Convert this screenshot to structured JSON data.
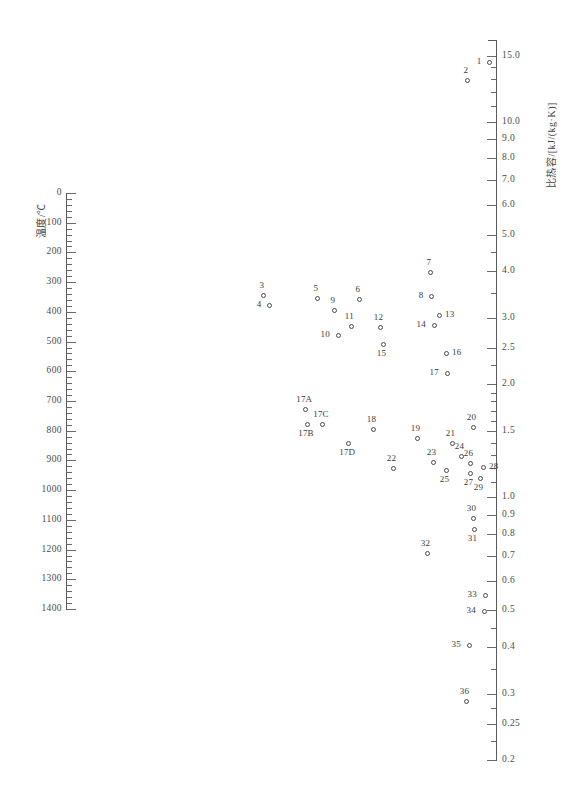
{
  "chart_data": {
    "type": "scatter",
    "title": "",
    "xlabel": "",
    "ylabel": "温度/℃",
    "y2label": "比热容/[kJ/(kg·K)]",
    "grid": false,
    "legend": "none",
    "left_axis": {
      "label": "温度/℃",
      "unit": "℃",
      "scale": "linear",
      "min": 0,
      "max": 1400,
      "major_step": 100,
      "minor_per_major": 5,
      "ticks": [
        0,
        100,
        200,
        300,
        400,
        500,
        600,
        700,
        800,
        900,
        1000,
        1100,
        1200,
        1300,
        1400
      ],
      "tick_labels": [
        "0",
        "100",
        "200",
        "300",
        "400",
        "500",
        "600",
        "700",
        "800",
        "900",
        "1000",
        "1100",
        "1200",
        "1300",
        "1400"
      ]
    },
    "right_axis": {
      "label": "比热容/[kJ/(kg·K)]",
      "unit": "kJ/(kg·K)",
      "scale": "log",
      "min": 0.2,
      "max": 16.5,
      "labeled_ticks": [
        15.0,
        10.0,
        9.0,
        8.0,
        7.0,
        6.0,
        5.0,
        4.0,
        3.0,
        2.5,
        2.0,
        1.5,
        1.0,
        0.9,
        0.8,
        0.7,
        0.6,
        0.5,
        0.4,
        0.3,
        0.25,
        0.2
      ],
      "labeled_tick_labels": [
        "15.0",
        "10.0",
        "9.0",
        "8.0",
        "7.0",
        "6.0",
        "5.0",
        "4.0",
        "3.0",
        "2.5",
        "2.0",
        "1.5",
        "1.0",
        "0.9",
        "0.8",
        "0.7",
        "0.6",
        "0.5",
        "0.4",
        "0.3",
        "0.25",
        "0.2"
      ],
      "minor_ticks": [
        14.0,
        13.0,
        12.0,
        11.0,
        4.5,
        3.5,
        2.25,
        1.9,
        1.8,
        1.7,
        1.6,
        1.4,
        1.3,
        1.2,
        1.1,
        0.45,
        0.35,
        0.275,
        0.225
      ]
    },
    "points": [
      {
        "id": "1",
        "label": "1",
        "x": 489,
        "y": 62,
        "specific_heat": 14.6,
        "label_pos": "left"
      },
      {
        "id": "2",
        "label": "2",
        "x": 467,
        "y": 80,
        "specific_heat": 13.1,
        "label_pos": "above"
      },
      {
        "id": "3",
        "label": "3",
        "x": 263,
        "y": 295,
        "specific_heat": 3.55,
        "label_pos": "above"
      },
      {
        "id": "4",
        "label": "4",
        "x": 269,
        "y": 305,
        "specific_heat": 3.4,
        "label_pos": "left"
      },
      {
        "id": "5",
        "label": "5",
        "x": 317,
        "y": 298,
        "specific_heat": 3.5,
        "label_pos": "above"
      },
      {
        "id": "6",
        "label": "6",
        "x": 359,
        "y": 299,
        "specific_heat": 3.48,
        "label_pos": "above"
      },
      {
        "id": "7",
        "label": "7",
        "x": 430,
        "y": 272,
        "specific_heat": 3.95,
        "label_pos": "above"
      },
      {
        "id": "8",
        "label": "8",
        "x": 431,
        "y": 296,
        "specific_heat": 3.55,
        "label_pos": "left"
      },
      {
        "id": "9",
        "label": "9",
        "x": 334,
        "y": 310,
        "specific_heat": 3.3,
        "label_pos": "above"
      },
      {
        "id": "10",
        "label": "10",
        "x": 338,
        "y": 335,
        "specific_heat": 2.95,
        "label_pos": "left"
      },
      {
        "id": "11",
        "label": "11",
        "x": 351,
        "y": 326,
        "specific_heat": 3.07,
        "label_pos": "above"
      },
      {
        "id": "12",
        "label": "12",
        "x": 380,
        "y": 327,
        "specific_heat": 3.05,
        "label_pos": "above"
      },
      {
        "id": "13",
        "label": "13",
        "x": 439,
        "y": 315,
        "specific_heat": 3.2,
        "label_pos": "right"
      },
      {
        "id": "14",
        "label": "14",
        "x": 434,
        "y": 325,
        "specific_heat": 3.08,
        "label_pos": "left"
      },
      {
        "id": "15",
        "label": "15",
        "x": 383,
        "y": 344,
        "specific_heat": 2.8,
        "label_pos": "below"
      },
      {
        "id": "16",
        "label": "16",
        "x": 446,
        "y": 353,
        "specific_heat": 2.55,
        "label_pos": "right"
      },
      {
        "id": "17",
        "label": "17",
        "x": 447,
        "y": 373,
        "specific_heat": 2.05,
        "label_pos": "left"
      },
      {
        "id": "17A",
        "label": "17A",
        "x": 305,
        "y": 409,
        "specific_heat": 1.72,
        "label_pos": "above"
      },
      {
        "id": "17B",
        "label": "17B",
        "x": 307,
        "y": 424,
        "specific_heat": 1.52,
        "label_pos": "below"
      },
      {
        "id": "17C",
        "label": "17C",
        "x": 322,
        "y": 424,
        "specific_heat": 1.52,
        "label_pos": "above"
      },
      {
        "id": "17D",
        "label": "17D",
        "x": 348,
        "y": 443,
        "specific_heat": 1.38,
        "label_pos": "below"
      },
      {
        "id": "18",
        "label": "18",
        "x": 373,
        "y": 429,
        "specific_heat": 1.48,
        "label_pos": "above"
      },
      {
        "id": "19",
        "label": "19",
        "x": 417,
        "y": 438,
        "specific_heat": 1.42,
        "label_pos": "above"
      },
      {
        "id": "20",
        "label": "20",
        "x": 473,
        "y": 427,
        "specific_heat": 1.5,
        "label_pos": "above"
      },
      {
        "id": "21",
        "label": "21",
        "x": 452,
        "y": 443,
        "specific_heat": 1.38,
        "label_pos": "above"
      },
      {
        "id": "22",
        "label": "22",
        "x": 393,
        "y": 468,
        "specific_heat": 1.13,
        "label_pos": "above"
      },
      {
        "id": "23",
        "label": "23",
        "x": 433,
        "y": 462,
        "specific_heat": 1.18,
        "label_pos": "above"
      },
      {
        "id": "24",
        "label": "24",
        "x": 461,
        "y": 456,
        "specific_heat": 1.22,
        "label_pos": "above"
      },
      {
        "id": "25",
        "label": "25",
        "x": 446,
        "y": 470,
        "specific_heat": 1.1,
        "label_pos": "below"
      },
      {
        "id": "26",
        "label": "26",
        "x": 470,
        "y": 463,
        "specific_heat": 1.16,
        "label_pos": "above"
      },
      {
        "id": "27",
        "label": "27",
        "x": 470,
        "y": 473,
        "specific_heat": 1.08,
        "label_pos": "below"
      },
      {
        "id": "28",
        "label": "28",
        "x": 483,
        "y": 467,
        "specific_heat": 1.12,
        "label_pos": "right"
      },
      {
        "id": "29",
        "label": "29",
        "x": 480,
        "y": 478,
        "specific_heat": 1.04,
        "label_pos": "below"
      },
      {
        "id": "30",
        "label": "30",
        "x": 473,
        "y": 518,
        "specific_heat": 0.9,
        "label_pos": "above"
      },
      {
        "id": "31",
        "label": "31",
        "x": 474,
        "y": 529,
        "specific_heat": 0.84,
        "label_pos": "below"
      },
      {
        "id": "32",
        "label": "32",
        "x": 427,
        "y": 553,
        "specific_heat": 0.72,
        "label_pos": "above"
      },
      {
        "id": "33",
        "label": "33",
        "x": 485,
        "y": 595,
        "specific_heat": 0.56,
        "label_pos": "left"
      },
      {
        "id": "34",
        "label": "34",
        "x": 484,
        "y": 611,
        "specific_heat": 0.52,
        "label_pos": "left"
      },
      {
        "id": "35",
        "label": "35",
        "x": 469,
        "y": 645,
        "specific_heat": 0.42,
        "label_pos": "left"
      },
      {
        "id": "36",
        "label": "36",
        "x": 466,
        "y": 701,
        "specific_heat": 0.3,
        "label_pos": "above"
      }
    ]
  },
  "geometry": {
    "left_axis_x": 66,
    "left_axis_top": 193,
    "left_axis_bottom": 609,
    "right_axis_x": 496,
    "right_axis_top": 40,
    "right_axis_bottom": 760
  }
}
